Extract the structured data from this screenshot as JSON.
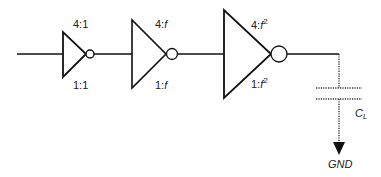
{
  "diagram": {
    "type": "inverter-chain",
    "stages": [
      {
        "id": "inv1",
        "pmos_ratio": "4:1",
        "nmos_ratio": "1:1",
        "pmos_prefix": "4:",
        "pmos_factor": "1",
        "pmos_exp": "",
        "nmos_prefix": "1:",
        "nmos_factor": "1",
        "nmos_exp": ""
      },
      {
        "id": "inv2",
        "pmos_ratio": "4:f",
        "nmos_ratio": "1:f",
        "pmos_prefix": "4:",
        "pmos_factor": "f",
        "pmos_exp": "",
        "nmos_prefix": "1:",
        "nmos_factor": "f",
        "nmos_exp": ""
      },
      {
        "id": "inv3",
        "pmos_ratio": "4:f^2",
        "nmos_ratio": "1:f^2",
        "pmos_prefix": "4:",
        "pmos_factor": "f",
        "pmos_exp": "2",
        "nmos_prefix": "1:",
        "nmos_factor": "f",
        "nmos_exp": "2"
      }
    ],
    "load": {
      "label_main": "C",
      "label_sub": "L",
      "ground_label": "GND"
    },
    "colors": {
      "line": "#111111",
      "dotted": "#333333",
      "text": "#222222",
      "background": "#ffffff"
    }
  }
}
